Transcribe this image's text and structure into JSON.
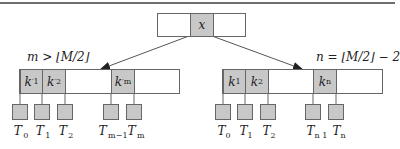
{
  "diagram": {
    "type": "b-tree-node-merge",
    "root": {
      "key": "x"
    },
    "left_node": {
      "condition": "m > ⌊M/2⌋",
      "keys": [
        {
          "base": "k",
          "prime": "′",
          "sub": "1"
        },
        {
          "base": "k",
          "prime": "′",
          "sub": "2"
        },
        {
          "base": "k",
          "prime": "′",
          "sub": "m"
        }
      ],
      "subtrees": [
        {
          "base": "T",
          "prime": "′",
          "sub": "0"
        },
        {
          "base": "T",
          "prime": "′",
          "sub": "1"
        },
        {
          "base": "T",
          "prime": "′",
          "sub": "2"
        },
        {
          "base": "T",
          "prime": "′",
          "sub": "m−1"
        },
        {
          "base": "T",
          "prime": "′",
          "sub": "m"
        }
      ]
    },
    "right_node": {
      "condition": "n = ⌊M/2⌋ − 2",
      "keys": [
        {
          "base": "k",
          "prime": "",
          "sub": "1"
        },
        {
          "base": "k",
          "prime": "",
          "sub": "2"
        },
        {
          "base": "k",
          "prime": "",
          "sub": "n"
        }
      ],
      "subtrees": [
        {
          "base": "T",
          "prime": "",
          "sub": "0"
        },
        {
          "base": "T",
          "prime": "",
          "sub": "1"
        },
        {
          "base": "T",
          "prime": "",
          "sub": "2"
        },
        {
          "base": "T",
          "prime": "",
          "sub": "n 1"
        },
        {
          "base": "T",
          "prime": "",
          "sub": "n"
        }
      ]
    },
    "colors": {
      "key_fill": "#c8c8c8",
      "border": "#666666",
      "line": "#555555"
    }
  }
}
